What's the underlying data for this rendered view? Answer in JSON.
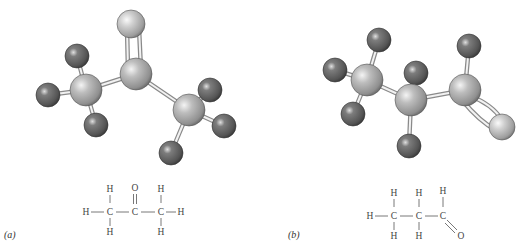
{
  "figure": {
    "panels": [
      {
        "label": "(a)",
        "molecule": "acetone",
        "formula_atoms": {
          "c1_top_h": "H",
          "c1_left_h": "H",
          "c1": "C",
          "c1_bottom_h": "H",
          "c2_top_o": "O",
          "c2": "C",
          "c3_top_h": "H",
          "c3": "C",
          "c3_right_h": "H",
          "c3_bottom_h": "H"
        }
      },
      {
        "label": "(b)",
        "molecule": "propanal",
        "formula_atoms": {
          "c1_top_h": "H",
          "c1_left_h": "H",
          "c1": "C",
          "c1_bottom_h": "H",
          "c2_top_h": "H",
          "c2": "C",
          "c2_bottom_h": "H",
          "c3_top_h": "H",
          "c3": "C",
          "c3_o": "O"
        }
      }
    ],
    "colors": {
      "carbon": "#b3b3b3",
      "hydrogen": "#6b6b6b",
      "oxygen": "#c9c9c9",
      "bond": "#d8d8d8"
    }
  }
}
